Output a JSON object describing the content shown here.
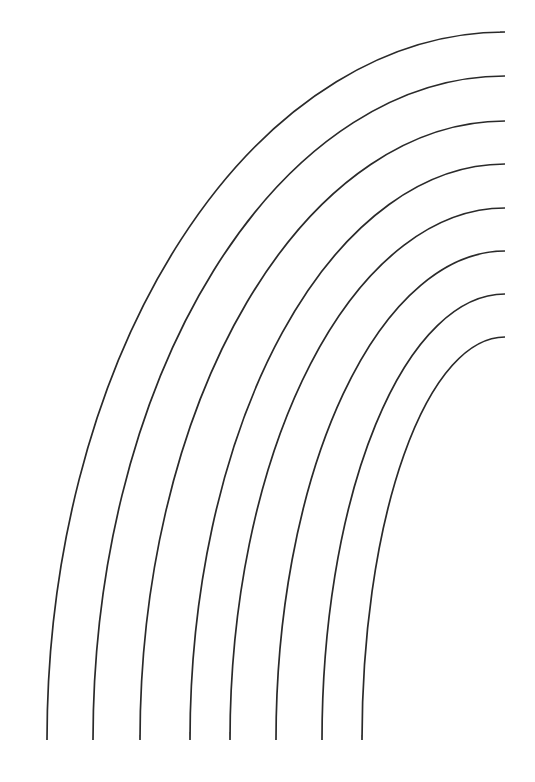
{
  "diagram": {
    "type": "concentric-quarter-arcs",
    "background": "#ffffff",
    "stroke_color": "#2a2a2a",
    "arc_count": 8,
    "center": {
      "x": 505,
      "y": 740
    },
    "arcs": [
      {
        "name": "arc-1",
        "start": {
          "x": 47,
          "y": 740
        },
        "end": {
          "x": 500,
          "y": 32
        },
        "rx": 458,
        "ry": 708
      },
      {
        "name": "arc-2",
        "start": {
          "x": 93,
          "y": 740
        },
        "end": {
          "x": 505,
          "y": 76
        },
        "rx": 412,
        "ry": 664
      },
      {
        "name": "arc-3",
        "start": {
          "x": 140,
          "y": 735
        },
        "end": {
          "x": 505,
          "y": 121
        },
        "rx": 365,
        "ry": 619
      },
      {
        "name": "arc-4",
        "start": {
          "x": 190,
          "y": 732
        },
        "end": {
          "x": 505,
          "y": 164
        },
        "rx": 315,
        "ry": 576
      },
      {
        "name": "arc-5",
        "start": {
          "x": 230,
          "y": 732
        },
        "end": {
          "x": 505,
          "y": 208
        },
        "rx": 275,
        "ry": 532
      },
      {
        "name": "arc-6",
        "start": {
          "x": 276,
          "y": 740
        },
        "end": {
          "x": 505,
          "y": 251
        },
        "rx": 229,
        "ry": 489
      },
      {
        "name": "arc-7",
        "start": {
          "x": 322,
          "y": 738
        },
        "end": {
          "x": 505,
          "y": 294
        },
        "rx": 183,
        "ry": 446
      },
      {
        "name": "arc-8",
        "start": {
          "x": 362,
          "y": 735
        },
        "end": {
          "x": 505,
          "y": 337
        },
        "rx": 143,
        "ry": 403
      }
    ]
  }
}
